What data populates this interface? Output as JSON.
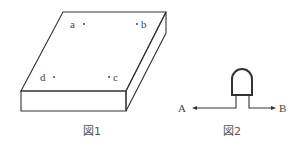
{
  "figure1": {
    "caption": "図1",
    "description": "Rectangular plate (box) in perspective with four marked points",
    "points": [
      {
        "label": "a",
        "x": 84,
        "y": 24
      },
      {
        "label": "b",
        "x": 137,
        "y": 24
      },
      {
        "label": "d",
        "x": 49,
        "y": 77
      },
      {
        "label": "c",
        "x": 109,
        "y": 77
      }
    ]
  },
  "figure2": {
    "caption": "図2",
    "description": "LED-like component with leads from terminal A to terminal B",
    "terminal_left": "A",
    "terminal_right": "B"
  },
  "colors": {
    "line": "#333333",
    "text": "#444444",
    "background": "#ffffff"
  }
}
